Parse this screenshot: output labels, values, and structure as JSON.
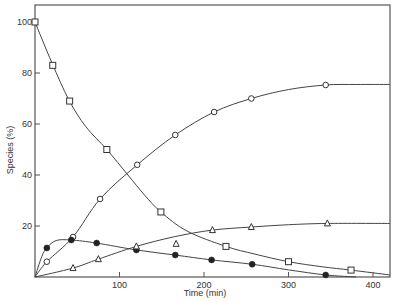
{
  "chart_data": {
    "type": "line",
    "title": "",
    "xlabel": "Time (min)",
    "ylabel": "Species (%)",
    "xlim": [
      0,
      420
    ],
    "ylim": [
      0,
      100
    ],
    "xticks": [
      100,
      200,
      300,
      400
    ],
    "yticks": [
      0,
      20,
      40,
      60,
      80,
      100
    ],
    "xtick_labels": [
      "100",
      "200",
      "300",
      "400"
    ],
    "ytick_labels": [
      "",
      "20",
      "40",
      "60",
      "80",
      "100"
    ],
    "grid": false,
    "legend": null,
    "series": [
      {
        "name": "open-square",
        "marker": "square-open",
        "x": [
          0,
          21,
          41,
          85,
          149,
          226,
          300,
          374
        ],
        "y": [
          100,
          83,
          69,
          50,
          25.5,
          12,
          6,
          2.7
        ],
        "curve": [
          [
            0,
            100
          ],
          [
            20,
            84
          ],
          [
            40,
            69.5
          ],
          [
            60,
            59
          ],
          [
            85,
            50
          ],
          [
            110,
            40
          ],
          [
            130,
            32
          ],
          [
            149,
            25.5
          ],
          [
            180,
            18
          ],
          [
            226,
            12
          ],
          [
            260,
            9
          ],
          [
            300,
            6
          ],
          [
            340,
            4
          ],
          [
            374,
            2.7
          ],
          [
            420,
            0.8
          ]
        ]
      },
      {
        "name": "open-circle",
        "marker": "circle-open",
        "x": [
          0,
          14,
          45,
          77,
          121,
          166,
          212,
          256,
          344
        ],
        "y": [
          0,
          6,
          15.7,
          30.6,
          44,
          55.7,
          64.7,
          70,
          75.3
        ],
        "curve": [
          [
            0,
            0
          ],
          [
            14,
            6
          ],
          [
            45,
            15.7
          ],
          [
            77,
            30.6
          ],
          [
            121,
            44
          ],
          [
            166,
            55.7
          ],
          [
            212,
            64.7
          ],
          [
            256,
            70
          ],
          [
            300,
            73.5
          ],
          [
            344,
            75.3
          ],
          [
            380,
            75.5
          ],
          [
            420,
            75.5
          ]
        ]
      },
      {
        "name": "filled-circle",
        "marker": "circle-filled",
        "x": [
          0,
          14,
          43,
          73,
          120,
          166,
          209,
          257,
          344
        ],
        "y": [
          0,
          11.4,
          14.5,
          13.3,
          10.6,
          8.6,
          6.7,
          5,
          0.8
        ],
        "curve": [
          [
            0,
            0
          ],
          [
            8,
            8
          ],
          [
            14,
            11.4
          ],
          [
            25,
            14.3
          ],
          [
            43,
            14.5
          ],
          [
            73,
            13.3
          ],
          [
            120,
            10.6
          ],
          [
            166,
            8.6
          ],
          [
            209,
            6.7
          ],
          [
            257,
            5
          ],
          [
            300,
            2.8
          ],
          [
            344,
            0.8
          ],
          [
            380,
            0
          ]
        ]
      },
      {
        "name": "open-triangle",
        "marker": "triangle-open",
        "x": [
          45,
          75,
          120,
          167,
          210,
          256,
          346
        ],
        "y": [
          3.5,
          7,
          12,
          13,
          18.4,
          19.6,
          21
        ],
        "curve": [
          [
            0,
            0
          ],
          [
            45,
            3.5
          ],
          [
            75,
            7
          ],
          [
            120,
            12
          ],
          [
            165,
            15.8
          ],
          [
            210,
            18.4
          ],
          [
            256,
            19.6
          ],
          [
            300,
            20.5
          ],
          [
            346,
            21
          ],
          [
            420,
            21
          ]
        ]
      }
    ]
  },
  "axes": {
    "x_title": "Time (min)",
    "y_title": "Species (%)"
  }
}
